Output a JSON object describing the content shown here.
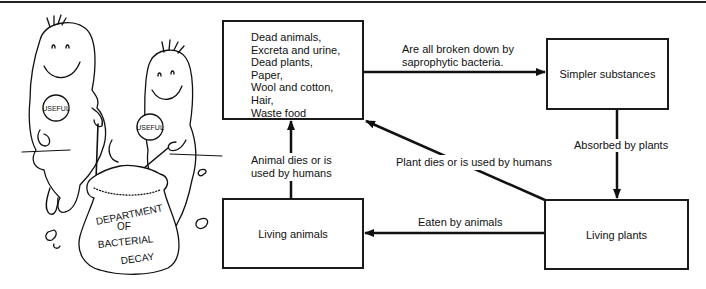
{
  "diagram": {
    "nodes": {
      "dead_matter": {
        "items": [
          "Dead animals,",
          "Excreta and urine,",
          "Dead plants,",
          "Paper,",
          "Wool and cotton,",
          "Hair,",
          "Waste food"
        ]
      },
      "simpler_substances": {
        "label": "Simpler substances"
      },
      "living_animals": {
        "label": "Living animals"
      },
      "living_plants": {
        "label": "Living plants"
      }
    },
    "edges": {
      "breakdown": {
        "line1": "Are all broken down by",
        "line2": "saprophytic bacteria."
      },
      "absorbed": {
        "label": "Absorbed by plants"
      },
      "eaten": {
        "label": "Eaten by animals"
      },
      "animal_dies": {
        "line1": "Animal dies or is",
        "line2": "used by humans"
      },
      "plant_dies": {
        "label": "Plant dies or is used by humans"
      }
    }
  },
  "illustration": {
    "badge_left": "USEFUL",
    "badge_right": "USEFUL",
    "sack_line1": "DEPARTMENT",
    "sack_line2": "OF",
    "sack_line3": "BACTERIAL",
    "sack_line4": "DECAY"
  }
}
